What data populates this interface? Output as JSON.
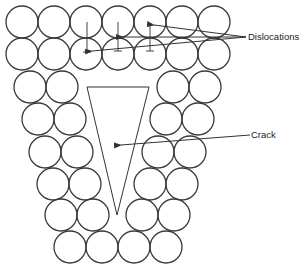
{
  "diagram": {
    "title": "",
    "labels": {
      "dislocations": "Dislocations",
      "crack": "Crack"
    },
    "atom_radius": 16,
    "atoms": [
      {
        "row": 1,
        "cx": [
          22,
          54,
          86,
          118,
          150,
          182,
          214
        ],
        "cy": 22
      },
      {
        "row": 2,
        "cx": [
          22,
          54,
          86,
          118,
          150,
          182,
          214
        ],
        "cy": 54
      },
      {
        "row": 3,
        "cx": [
          30,
          62,
          173,
          205
        ],
        "cy": 87
      },
      {
        "row": 4,
        "cx": [
          38,
          70,
          166,
          198
        ],
        "cy": 119
      },
      {
        "row": 5,
        "cx": [
          45,
          77,
          158,
          190
        ],
        "cy": 152
      },
      {
        "row": 6,
        "cx": [
          53,
          85,
          150,
          182
        ],
        "cy": 184
      },
      {
        "row": 7,
        "cx": [
          61,
          93,
          142,
          174
        ],
        "cy": 215
      },
      {
        "row": 8,
        "cx": [
          70,
          102,
          134,
          166
        ],
        "cy": 247
      }
    ],
    "crack_polygon": [
      [
        87,
        87
      ],
      [
        149,
        87
      ],
      [
        117,
        215
      ]
    ],
    "dislocations": [
      {
        "x": 87,
        "top": 22,
        "bottom": 52
      },
      {
        "x": 118,
        "top": 22,
        "bottom": 51
      },
      {
        "x": 150,
        "top": 23,
        "bottom": 51
      }
    ],
    "colors": {
      "stroke": "#333333",
      "background": "#ffffff"
    }
  }
}
